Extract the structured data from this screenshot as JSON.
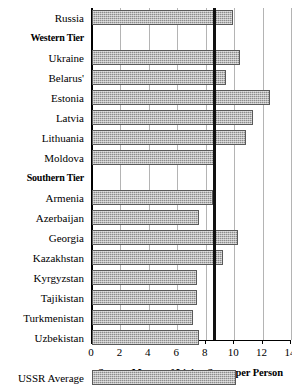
{
  "chart_data": {
    "type": "bar",
    "orientation": "horizontal",
    "title": "",
    "xlabel": "Square Metres of Living Space per Person",
    "ylabel": "",
    "xlim": [
      0,
      14
    ],
    "xticks": [
      0,
      2,
      4,
      6,
      8,
      10,
      12,
      14
    ],
    "xtick_labels": [
      "0",
      "2",
      "4",
      "6",
      "8",
      "10",
      "12",
      "14"
    ],
    "grid": true,
    "grid_axis": "x",
    "legend": false,
    "reference_line": {
      "value": 8.6,
      "label": ""
    },
    "bar_color": "#8c8c8c",
    "bar_edge_color": "#5a5a5a",
    "axis_color": "#000000",
    "gridline_color": "#b4b4b4",
    "categories": [
      "Russia",
      "Western Tier",
      "Ukraine",
      "Belarus'",
      "Estonia",
      "Latvia",
      "Lithuania",
      "Moldova",
      "Southern Tier",
      "Armenia",
      "Azerbaijan",
      "Georgia",
      "Kazakhstan",
      "Kyrgyzstan",
      "Tajikistan",
      "Turkmenistan",
      "Uzbekistan",
      "",
      "USSR Average"
    ],
    "rows": [
      {
        "label": "Russia",
        "value": 9.9,
        "type": "bar"
      },
      {
        "label": "Western Tier",
        "value": null,
        "type": "header"
      },
      {
        "label": "Ukraine",
        "value": 10.4,
        "type": "bar"
      },
      {
        "label": "Belarus'",
        "value": 9.4,
        "type": "bar"
      },
      {
        "label": "Estonia",
        "value": 12.5,
        "type": "bar"
      },
      {
        "label": "Latvia",
        "value": 11.3,
        "type": "bar"
      },
      {
        "label": "Lithuania",
        "value": 10.8,
        "type": "bar"
      },
      {
        "label": "Moldova",
        "value": 8.7,
        "type": "bar"
      },
      {
        "label": "Southern Tier",
        "value": null,
        "type": "header"
      },
      {
        "label": "Armenia",
        "value": 8.5,
        "type": "bar"
      },
      {
        "label": "Azerbaijan",
        "value": 7.5,
        "type": "bar"
      },
      {
        "label": "Georgia",
        "value": 10.3,
        "type": "bar"
      },
      {
        "label": "Kazakhstan",
        "value": 9.2,
        "type": "bar"
      },
      {
        "label": "Kyrgyzstan",
        "value": 7.4,
        "type": "bar"
      },
      {
        "label": "Tajikistan",
        "value": 7.4,
        "type": "bar"
      },
      {
        "label": "Turkmenistan",
        "value": 7.1,
        "type": "bar"
      },
      {
        "label": "Uzbekistan",
        "value": 7.5,
        "type": "bar"
      },
      {
        "label": "",
        "value": null,
        "type": "spacer"
      },
      {
        "label": "USSR Average",
        "value": 10.1,
        "type": "bar"
      }
    ],
    "values": [
      9.9,
      null,
      10.4,
      9.4,
      12.5,
      11.3,
      10.8,
      8.7,
      null,
      8.5,
      7.5,
      10.3,
      9.2,
      7.4,
      7.4,
      7.1,
      7.5,
      null,
      10.1
    ]
  }
}
